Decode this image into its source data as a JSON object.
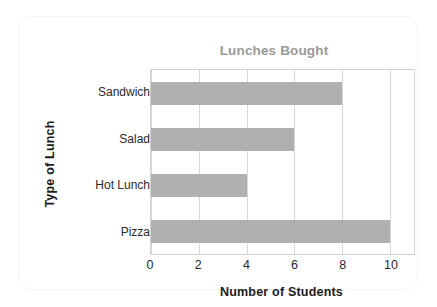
{
  "card": {
    "background": "#ffffff",
    "border_color": "#f4f4f4"
  },
  "chart_data": {
    "type": "bar",
    "orientation": "horizontal",
    "title": "Lunches Bought",
    "xlabel": "Number of Students",
    "ylabel": "Type of Lunch",
    "categories": [
      "Sandwich",
      "Salad",
      "Hot Lunch",
      "Pizza"
    ],
    "values": [
      8,
      6,
      4,
      10
    ],
    "xlim": [
      0,
      11
    ],
    "xticks": [
      0,
      2,
      4,
      6,
      8,
      10
    ],
    "xtick_labels": [
      "0",
      "2",
      "4",
      "6",
      "8",
      "10"
    ],
    "gridlines": [
      0,
      2,
      4,
      6,
      8,
      10,
      11
    ],
    "grid": true,
    "grid_axis": "x",
    "legend": null,
    "bar_color": "#b0b0b0",
    "title_color": "#9a9a9a",
    "axis_label_color": "#1c1c1c",
    "tick_label_color": "#2a2a2a",
    "grid_color": "#d8d8d8",
    "plot_border_color": "#d2d2d2",
    "bars": [
      {
        "category": "Sandwich",
        "value": 8
      },
      {
        "category": "Salad",
        "value": 6
      },
      {
        "category": "Hot Lunch",
        "value": 4
      },
      {
        "category": "Pizza",
        "value": 10
      }
    ]
  }
}
